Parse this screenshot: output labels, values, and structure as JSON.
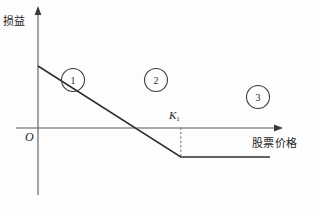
{
  "figure": {
    "axes": {
      "y_label": "损益",
      "x_label": "股票价格",
      "origin_label": "O",
      "strike_label_base": "K",
      "strike_label_sub": "1"
    },
    "markers": [
      {
        "name": "region-1",
        "label": "1"
      },
      {
        "name": "region-2",
        "label": "2"
      },
      {
        "name": "region-3",
        "label": "3"
      }
    ],
    "colors": {
      "axis": "#5a5a5a",
      "payoff": "#2e2e2e",
      "guide": "#6b6b6b",
      "background": "#fdfdfd"
    }
  },
  "chart_data": {
    "type": "line",
    "title": "",
    "xlabel": "股票价格",
    "ylabel": "损益",
    "grid": false,
    "legend": null,
    "xlim": [
      0,
      100
    ],
    "ylim": [
      -40,
      60
    ],
    "series": [
      {
        "name": "payoff",
        "comment": "short call payoff: downward sloping then flat",
        "x": [
          22,
          70,
          100
        ],
        "y": [
          44,
          -21,
          -21
        ]
      }
    ],
    "annotations": [
      {
        "text": "O",
        "x": 0,
        "y": 0,
        "role": "origin"
      },
      {
        "text": "K1",
        "x": 70,
        "y": 0,
        "role": "strike-tick"
      },
      {
        "text": "1",
        "x": 17,
        "y": 31,
        "role": "region-marker"
      },
      {
        "text": "2",
        "x": 56,
        "y": 31,
        "role": "region-marker"
      },
      {
        "text": "3",
        "x": 100,
        "y": 19,
        "role": "region-marker"
      }
    ],
    "guides": [
      {
        "type": "vline-dashed",
        "x": 70,
        "y_from": 0,
        "y_to": -21
      }
    ]
  }
}
